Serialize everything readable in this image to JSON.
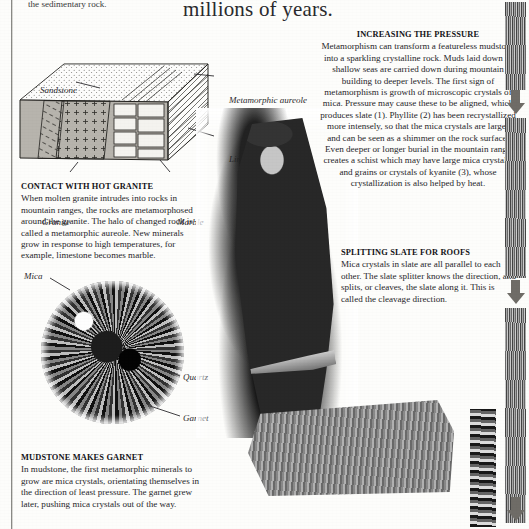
{
  "page": {
    "running_head": "the sedimentary rock.",
    "headline": "millions of years."
  },
  "diagram": {
    "name": "granite-intrusion-block-diagram",
    "labels": {
      "sandstone": "Sandstone",
      "metamorphic_aureole": "Metamorphic aureole",
      "limestone": "Limestone",
      "granite": "Granite",
      "marble": "Marble"
    }
  },
  "micrograph": {
    "name": "garnet-thin-section",
    "labels": {
      "mica": "Mica",
      "quartz": "Quartz",
      "garnet": "Garnet"
    }
  },
  "captions": {
    "contact_granite": {
      "heading": "CONTACT WITH HOT GRANITE",
      "body": "When molten granite intrudes into rocks in mountain ranges, the rocks are metamorphosed around the granite. The halo of changed rock is called a metamorphic aureole. New minerals grow in response to high temperatures, for example, limestone becomes marble."
    },
    "mudstone_garnet": {
      "heading": "MUDSTONE MAKES GARNET",
      "body": "In mudstone, the first metamorphic minerals to grow are mica crystals, orientating themselves in the direction of least pressure. The garnet grew later, pushing mica crystals out of the way."
    },
    "increasing_pressure": {
      "heading": "INCREASING THE PRESSURE",
      "body": "Metamorphism can transform a featureless mudstone into a sparkling crystalline rock. Muds laid down in shallow seas are carried down during mountain building to deeper levels. The first sign of metamorphism is growth of microscopic crystals of mica. Pressure may cause these to be aligned, which produces slate (1). Phyllite (2) has been recrystallized more intensely, so that the mica crystals are larger and can be seen as a shimmer on the rock surface. Even deeper or longer burial in the mountain range creates a schist which may have large mica crystals, and grains or crystals of kyanite (3), whose crystallization is also helped by heat."
    },
    "splitting_slate": {
      "heading": "SPLITTING SLATE FOR ROOFS",
      "body": "Mica crystals in slate are all parallel to each other. The slate splitter knows the direction, and splits, or cleaves, the slate along it. This is called the cleavage direction."
    }
  },
  "photo": {
    "name": "slate-splitter-photograph",
    "alt": "slate splitter working a slab"
  },
  "sidebar": {
    "name": "rock-sample-strip-column",
    "strips": [
      "slate-sample-strip",
      "phyllite-sample-strip",
      "schist-sample-strip"
    ],
    "arrows": [
      "down-arrow-1",
      "down-arrow-2",
      "down-arrow-3"
    ]
  },
  "colors": {
    "paper": "#fdfdfb",
    "ink": "#27262a",
    "rule": "#8a8a86"
  }
}
